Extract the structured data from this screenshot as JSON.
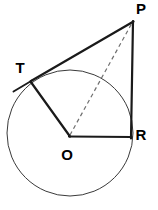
{
  "figure": {
    "width": 158,
    "height": 210,
    "background_color": "#ffffff",
    "stroke_color": "#1a1a1a",
    "circle_stroke_color": "#3a3a3a",
    "dashed_stroke_color": "#6f6f6f"
  },
  "circle": {
    "name": "circle-O",
    "center_label": "O",
    "cx": 70,
    "cy": 133,
    "r": 63
  },
  "points": [
    {
      "id": "P",
      "label": "P",
      "x": 133,
      "y": 21,
      "label_x": 141,
      "label_y": 10,
      "role": "external-point"
    },
    {
      "id": "T",
      "label": "T",
      "x": 31,
      "y": 81,
      "label_x": 20,
      "label_y": 69,
      "role": "tangent-point"
    },
    {
      "id": "R",
      "label": "R",
      "x": 130,
      "y": 137,
      "label_x": 141,
      "label_y": 136,
      "role": "circle-point"
    },
    {
      "id": "O",
      "label": "O",
      "x": 70,
      "y": 136,
      "label_x": 67,
      "label_y": 156,
      "role": "center"
    }
  ],
  "segments": [
    {
      "id": "PT",
      "label": "PT",
      "style": "solid",
      "x1": 133,
      "y1": 21,
      "x2": 31,
      "y2": 81,
      "description": "tangent line from P to T"
    },
    {
      "id": "T-extension",
      "label": "T extension",
      "style": "solid",
      "x1": 31,
      "y1": 81,
      "x2": 14,
      "y2": 91,
      "description": "tangent line extended past T"
    },
    {
      "id": "PR",
      "label": "PR",
      "style": "solid",
      "x1": 133,
      "y1": 21,
      "x2": 131,
      "y2": 138,
      "description": "vertical segment from P to R"
    },
    {
      "id": "OT",
      "label": "OT",
      "style": "solid",
      "x1": 70,
      "y1": 136,
      "x2": 31,
      "y2": 82,
      "description": "radius from O to T"
    },
    {
      "id": "OR",
      "label": "OR",
      "style": "solid",
      "x1": 70,
      "y1": 136,
      "x2": 131,
      "y2": 137,
      "description": "radius from O to R"
    },
    {
      "id": "OP",
      "label": "OP",
      "style": "dashed",
      "x1": 70,
      "y1": 135,
      "x2": 132,
      "y2": 23,
      "description": "dashed line from center O to external point P"
    }
  ]
}
